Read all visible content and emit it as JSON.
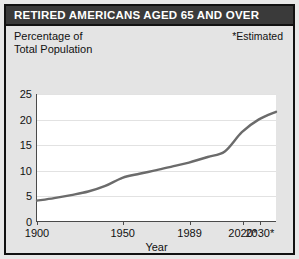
{
  "title": "RETIRED AMERICANS AGED 65 AND OVER",
  "axis_caption_line1": "Percentage of",
  "axis_caption_line2": "Total Population",
  "estimated_note": "*Estimated",
  "colors": {
    "title_bar": "#3a3a3a",
    "title_text": "#ffffff",
    "frame": "#111111",
    "background": "#e4e4e4",
    "plot_background": "#ffffff",
    "line": "#6b6b6b",
    "gridline": "#e2e2e2",
    "axis": "#4a4a4a"
  },
  "chart_data": {
    "type": "line",
    "title": "RETIRED AMERICANS AGED 65 AND OVER",
    "subtitle": "Percentage of Total Population",
    "annotation": "*Estimated",
    "xlabel": "Year",
    "ylabel": "Percentage of Total Population",
    "grid": true,
    "legend": "none",
    "xlim": [
      1900,
      2040
    ],
    "ylim": [
      0,
      25
    ],
    "yticks": [
      0,
      5,
      10,
      15,
      20,
      25
    ],
    "ytick_labels": [
      "0",
      "5",
      "10",
      "15",
      "20",
      "25"
    ],
    "xticks": [
      1900,
      1950,
      1989,
      2020,
      2030
    ],
    "xtick_labels": [
      "1900",
      "1950",
      "1989",
      "2020*",
      "2030*"
    ],
    "series": [
      {
        "name": "Percentage of total population aged 65 and over",
        "color": "#6b6b6b",
        "x": [
          1900,
          1910,
          1920,
          1930,
          1940,
          1950,
          1960,
          1970,
          1980,
          1989,
          2000,
          2010,
          2020,
          2030,
          2040
        ],
        "values": [
          4.0,
          4.5,
          5.1,
          5.8,
          6.9,
          8.5,
          9.3,
          10.0,
          10.8,
          11.5,
          12.6,
          13.7,
          17.5,
          20.0,
          21.5
        ]
      }
    ]
  }
}
